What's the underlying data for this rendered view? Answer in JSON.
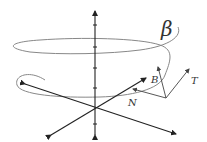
{
  "diagram": {
    "labels": {
      "curve": "β",
      "binormal": "B",
      "normal": "N",
      "tangent": "T"
    },
    "colors": {
      "axes": "#222222",
      "helix": "#888888",
      "vectors": "#444444",
      "text": "#333333"
    }
  }
}
